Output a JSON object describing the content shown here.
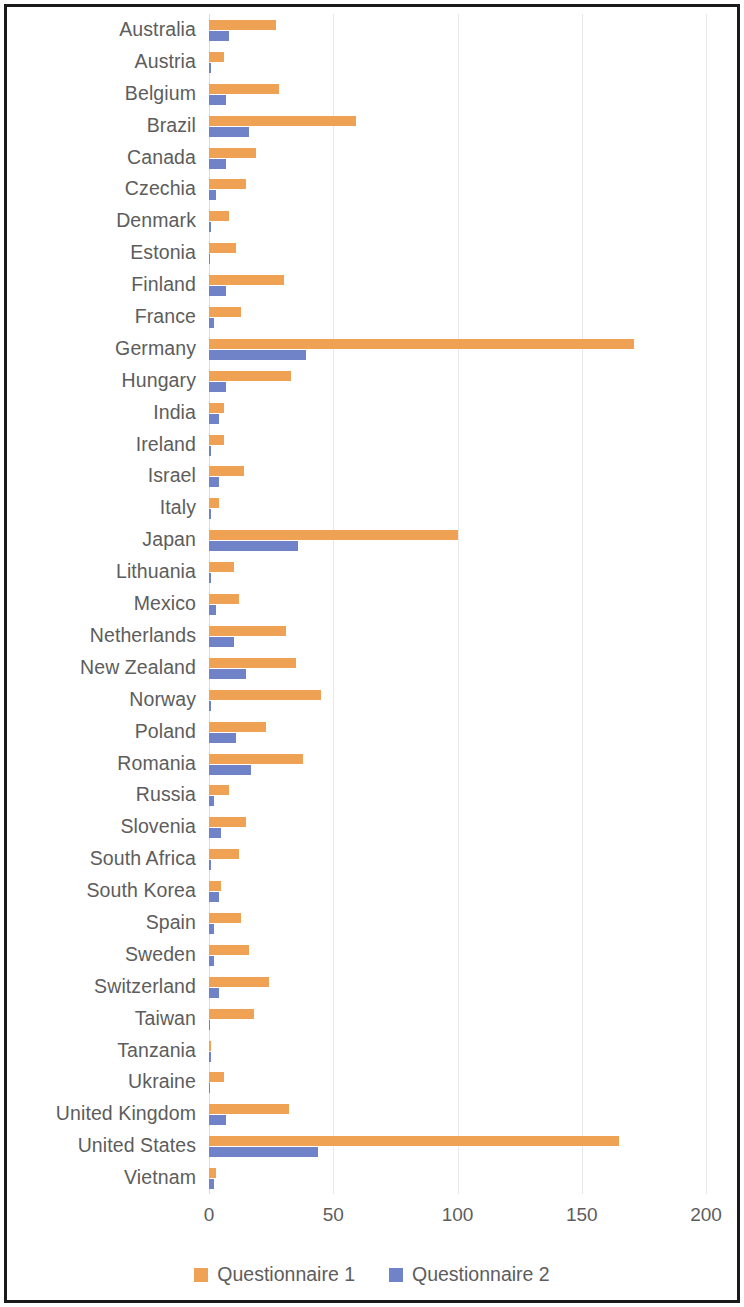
{
  "chart_data": {
    "type": "bar",
    "orientation": "horizontal",
    "title": "",
    "xlabel": "",
    "ylabel": "",
    "xlim": [
      0,
      200
    ],
    "xticks": [
      0,
      50,
      100,
      150,
      200
    ],
    "xtick_labels": [
      "0",
      "50",
      "100",
      "150",
      "200"
    ],
    "grid": true,
    "legend_position": "bottom",
    "categories": [
      "Australia",
      "Austria",
      "Belgium",
      "Brazil",
      "Canada",
      "Czechia",
      "Denmark",
      "Estonia",
      "Finland",
      "France",
      "Germany",
      "Hungary",
      "India",
      "Ireland",
      "Israel",
      "Italy",
      "Japan",
      "Lithuania",
      "Mexico",
      "Netherlands",
      "New Zealand",
      "Norway",
      "Poland",
      "Romania",
      "Russia",
      "Slovenia",
      "South Africa",
      "South Korea",
      "Spain",
      "Sweden",
      "Switzerland",
      "Taiwan",
      "Tanzania",
      "Ukraine",
      "United Kingdom",
      "United States",
      "Vietnam"
    ],
    "series": [
      {
        "name": "Questionnaire 1",
        "color": "#efa154",
        "values": [
          27,
          6,
          28,
          59,
          19,
          15,
          8,
          11,
          30,
          13,
          171,
          33,
          6,
          6,
          14,
          4,
          100,
          10,
          12,
          31,
          35,
          45,
          23,
          38,
          8,
          15,
          12,
          5,
          13,
          16,
          24,
          18,
          1,
          6,
          32,
          165,
          3
        ]
      },
      {
        "name": "Questionnaire 2",
        "color": "#7083c8",
        "values": [
          8,
          1,
          7,
          16,
          7,
          3,
          1,
          0,
          7,
          2,
          39,
          7,
          4,
          1,
          4,
          1,
          36,
          1,
          3,
          10,
          15,
          1,
          11,
          17,
          2,
          5,
          1,
          4,
          2,
          2,
          4,
          0,
          1,
          0,
          7,
          44,
          2
        ]
      }
    ]
  },
  "legend": {
    "items": [
      {
        "label": "Questionnaire 1",
        "color": "#efa154"
      },
      {
        "label": "Questionnaire 2",
        "color": "#7083c8"
      }
    ]
  }
}
